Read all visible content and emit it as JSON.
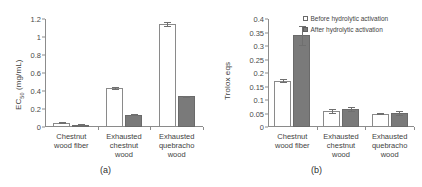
{
  "figure": {
    "panels": [
      {
        "caption": "(a)",
        "ylabel_main": "EC",
        "ylabel_sub": "50",
        "ylabel_unit": " (mg/mL)"
      },
      {
        "caption": "(b)",
        "ylabel_main": "Trolox eqs",
        "ylabel_sub": "",
        "ylabel_unit": ""
      }
    ],
    "legend": {
      "items": [
        {
          "label": "Before hydrolytic activation",
          "swatch": "open-square-white",
          "color": "#ffffff"
        },
        {
          "label": "After hydrolytic activation",
          "swatch": "filled-square-gray",
          "color": "#7a7a7a"
        }
      ]
    }
  },
  "chart_data": [
    {
      "type": "bar",
      "title": "(a)",
      "xlabel": "",
      "ylabel": "EC50 (mg/mL)",
      "ylim": [
        0,
        1.2
      ],
      "yticks": [
        "0",
        "0.2",
        "0.4",
        "0.6",
        "0.8",
        "1",
        "1.2"
      ],
      "ytick_values": [
        0,
        0.2,
        0.4,
        0.6,
        0.8,
        1.0,
        1.2
      ],
      "grid": false,
      "legend_position": "none",
      "categories": [
        "Chestnut wood fiber",
        "Exhausted chestnut wood",
        "Exhausted quebracho wood"
      ],
      "category_lines": [
        [
          "Chestnut",
          "wood fiber"
        ],
        [
          "Exhausted",
          "chestnut",
          "wood"
        ],
        [
          "Exhausted",
          "quebracho",
          "wood"
        ]
      ],
      "series": [
        {
          "name": "Before hydrolytic activation",
          "values": [
            0.05,
            0.435,
            1.145
          ],
          "errors": [
            0.007,
            0.008,
            0.025
          ]
        },
        {
          "name": "After hydrolytic activation",
          "values": [
            0.025,
            0.137,
            0.34
          ],
          "errors": [
            0.004,
            0.008,
            0.008
          ]
        }
      ]
    },
    {
      "type": "bar",
      "title": "(b)",
      "xlabel": "",
      "ylabel": "Trolox eqs",
      "ylim": [
        0,
        0.4
      ],
      "yticks": [
        "0",
        "0.05",
        "0.1",
        "0.15",
        "0.2",
        "0.25",
        "0.3",
        "0.35",
        "0.4"
      ],
      "ytick_values": [
        0,
        0.05,
        0.1,
        0.15,
        0.2,
        0.25,
        0.3,
        0.35,
        0.4
      ],
      "grid": false,
      "legend_position": "top-right",
      "categories": [
        "Chestnut wood fiber",
        "Exhausted chestnut wood",
        "Exhausted quebracho wood"
      ],
      "category_lines": [
        [
          "Chestnut",
          "wood fiber"
        ],
        [
          "Exhausted",
          "chestnut",
          "wood"
        ],
        [
          "Exhausted",
          "quebracho",
          "wood"
        ]
      ],
      "series": [
        {
          "name": "Before hydrolytic activation",
          "values": [
            0.172,
            0.06,
            0.05
          ],
          "errors": [
            0.007,
            0.008,
            0.003
          ]
        },
        {
          "name": "After hydrolytic activation",
          "values": [
            0.34,
            0.067,
            0.052
          ],
          "errors": [
            0.035,
            0.007,
            0.007
          ]
        }
      ]
    }
  ]
}
